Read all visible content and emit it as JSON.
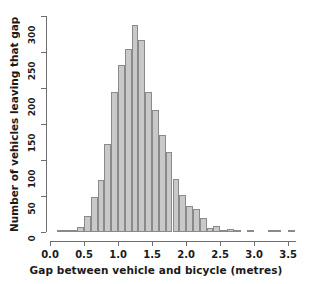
{
  "chart_data": {
    "type": "bar",
    "title": "",
    "subtitle": "",
    "xlabel": "Gap between vehicle and bicycle (metres)",
    "ylabel": "Number of vehicles leaving that gap",
    "grid": false,
    "legend": null,
    "bin_width": 0.1,
    "xlim": [
      0.0,
      3.6
    ],
    "ylim": [
      0,
      300
    ],
    "xticks": [
      0.0,
      0.5,
      1.0,
      1.5,
      2.0,
      2.5,
      3.0,
      3.5
    ],
    "xtick_labels": [
      "0.0",
      "0.5",
      "1.0",
      "1.5",
      "2.0",
      "2.5",
      "3.0",
      "3.5"
    ],
    "yticks": [
      0,
      50,
      100,
      150,
      200,
      250,
      300
    ],
    "ytick_labels": [
      "0",
      "50",
      "100",
      "150",
      "200",
      "250",
      "300"
    ],
    "bar_fill": "#c9c9c9",
    "bar_border": "#8a8a8a",
    "axis_color": "#6e6e6e",
    "bin_starts": [
      0.0,
      0.1,
      0.2,
      0.3,
      0.4,
      0.5,
      0.6,
      0.7,
      0.8,
      0.9,
      1.0,
      1.1,
      1.2,
      1.3,
      1.4,
      1.5,
      1.6,
      1.7,
      1.8,
      1.9,
      2.0,
      2.1,
      2.2,
      2.3,
      2.4,
      2.5,
      2.6,
      2.7,
      2.8,
      2.9,
      3.0,
      3.1,
      3.2,
      3.3,
      3.4,
      3.5
    ],
    "categories": [
      "0.0-0.1",
      "0.1-0.2",
      "0.2-0.3",
      "0.3-0.4",
      "0.4-0.5",
      "0.5-0.6",
      "0.6-0.7",
      "0.7-0.8",
      "0.8-0.9",
      "0.9-1.0",
      "1.0-1.1",
      "1.1-1.2",
      "1.2-1.3",
      "1.3-1.4",
      "1.4-1.5",
      "1.5-1.6",
      "1.6-1.7",
      "1.7-1.8",
      "1.8-1.9",
      "1.9-2.0",
      "2.0-2.1",
      "2.1-2.2",
      "2.2-2.3",
      "2.3-2.4",
      "2.4-2.5",
      "2.5-2.6",
      "2.6-2.7",
      "2.7-2.8",
      "2.8-2.9",
      "2.9-3.0",
      "3.0-3.1",
      "3.1-3.2",
      "3.2-3.3",
      "3.3-3.4",
      "3.4-3.5",
      "3.5-3.6"
    ],
    "values": [
      0,
      1,
      3,
      2,
      7,
      22,
      48,
      72,
      122,
      195,
      232,
      254,
      287,
      267,
      194,
      170,
      135,
      111,
      73,
      51,
      36,
      32,
      20,
      6,
      8,
      2,
      4,
      1,
      0,
      1,
      0,
      0,
      1,
      1,
      0,
      1
    ]
  }
}
